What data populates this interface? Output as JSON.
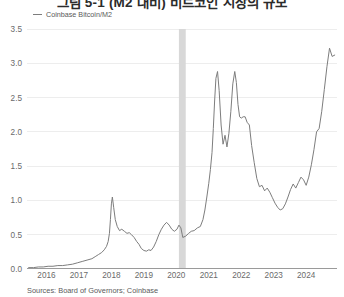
{
  "title": "그림 5-1 (M2 대비) 비트코인 시장의 규모",
  "legend": {
    "items": [
      {
        "label": "Coinbase Bitcoin/M2",
        "color": "#7d7d7d",
        "marker": "line-swatch"
      }
    ]
  },
  "source": "Sources: Board of Governors; Coinbase",
  "colors": {
    "line": "#7d7d7d",
    "grid": "#ededed",
    "axis": "#9a9a9a",
    "recession_band": "#d8d8d8",
    "tick_label": "#6a6a6a",
    "title": "#2b2b2b",
    "background": "#ffffff"
  },
  "chart_data": {
    "type": "line",
    "title": "그림 5-1 (M2 대비) 비트코인 시장의 규모",
    "xlabel": "",
    "ylabel": "",
    "xlim": [
      2015.4,
      2024.95
    ],
    "ylim": [
      0.0,
      3.5
    ],
    "grid": true,
    "legend_position": "top-left",
    "yticks": [
      "0.0",
      "0.5",
      "1.0",
      "1.5",
      "2.0",
      "2.5",
      "3.0",
      "3.5"
    ],
    "ytick_values": [
      0.0,
      0.5,
      1.0,
      1.5,
      2.0,
      2.5,
      3.0,
      3.5
    ],
    "xticks": [
      "2016",
      "2017",
      "2018",
      "2019",
      "2020",
      "2021",
      "2022",
      "2023",
      "2024"
    ],
    "xtick_values": [
      2016,
      2017,
      2018,
      2019,
      2020,
      2021,
      2022,
      2023,
      2024
    ],
    "annotations": [
      {
        "kind": "recession-band",
        "label": "2020 recession",
        "x_start": 2020.08,
        "x_end": 2020.29,
        "color": "#d8d8d8"
      }
    ],
    "series": [
      {
        "name": "Coinbase Bitcoin/M2",
        "color": "#7d7d7d",
        "x": [
          2015.45,
          2015.6,
          2015.75,
          2015.9,
          2016.05,
          2016.2,
          2016.35,
          2016.5,
          2016.65,
          2016.8,
          2016.95,
          2017.1,
          2017.25,
          2017.4,
          2017.5,
          2017.6,
          2017.7,
          2017.78,
          2017.85,
          2017.9,
          2017.94,
          2017.97,
          2018.0,
          2018.03,
          2018.07,
          2018.12,
          2018.18,
          2018.25,
          2018.32,
          2018.4,
          2018.48,
          2018.55,
          2018.62,
          2018.7,
          2018.78,
          2018.85,
          2018.92,
          2019.0,
          2019.08,
          2019.15,
          2019.22,
          2019.3,
          2019.38,
          2019.46,
          2019.54,
          2019.62,
          2019.7,
          2019.78,
          2019.86,
          2019.94,
          2020.02,
          2020.08,
          2020.14,
          2020.2,
          2020.29,
          2020.38,
          2020.46,
          2020.55,
          2020.65,
          2020.74,
          2020.82,
          2020.88,
          2020.94,
          2021.0,
          2021.05,
          2021.1,
          2021.14,
          2021.18,
          2021.22,
          2021.27,
          2021.32,
          2021.38,
          2021.44,
          2021.5,
          2021.56,
          2021.62,
          2021.68,
          2021.74,
          2021.8,
          2021.85,
          2021.9,
          2021.95,
          2022.0,
          2022.06,
          2022.12,
          2022.18,
          2022.25,
          2022.32,
          2022.4,
          2022.48,
          2022.56,
          2022.64,
          2022.72,
          2022.8,
          2022.88,
          2022.96,
          2023.04,
          2023.12,
          2023.2,
          2023.28,
          2023.36,
          2023.44,
          2023.52,
          2023.6,
          2023.68,
          2023.76,
          2023.84,
          2023.92,
          2024.0,
          2024.08,
          2024.16,
          2024.24,
          2024.32,
          2024.4,
          2024.48,
          2024.56,
          2024.64,
          2024.72,
          2024.8,
          2024.88
        ],
        "y": [
          0.02,
          0.02,
          0.03,
          0.03,
          0.04,
          0.04,
          0.05,
          0.05,
          0.06,
          0.07,
          0.09,
          0.11,
          0.13,
          0.15,
          0.18,
          0.21,
          0.24,
          0.28,
          0.33,
          0.4,
          0.52,
          0.72,
          0.95,
          1.05,
          0.9,
          0.72,
          0.62,
          0.56,
          0.58,
          0.55,
          0.52,
          0.53,
          0.5,
          0.46,
          0.4,
          0.36,
          0.3,
          0.27,
          0.26,
          0.28,
          0.27,
          0.32,
          0.4,
          0.5,
          0.58,
          0.64,
          0.68,
          0.64,
          0.58,
          0.55,
          0.58,
          0.64,
          0.6,
          0.46,
          0.48,
          0.52,
          0.55,
          0.56,
          0.6,
          0.62,
          0.72,
          0.86,
          1.05,
          1.25,
          1.45,
          1.7,
          2.05,
          2.45,
          2.78,
          2.88,
          2.6,
          2.1,
          1.82,
          1.95,
          1.78,
          1.98,
          2.3,
          2.7,
          2.88,
          2.72,
          2.4,
          2.22,
          2.2,
          2.22,
          2.22,
          2.14,
          2.1,
          1.8,
          1.55,
          1.32,
          1.2,
          1.22,
          1.14,
          1.18,
          1.12,
          1.04,
          0.96,
          0.9,
          0.86,
          0.88,
          0.95,
          1.05,
          1.16,
          1.24,
          1.18,
          1.26,
          1.34,
          1.3,
          1.22,
          1.34,
          1.52,
          1.74,
          2.0,
          2.05,
          2.3,
          2.62,
          2.95,
          3.22,
          3.1,
          3.12
        ]
      }
    ]
  }
}
